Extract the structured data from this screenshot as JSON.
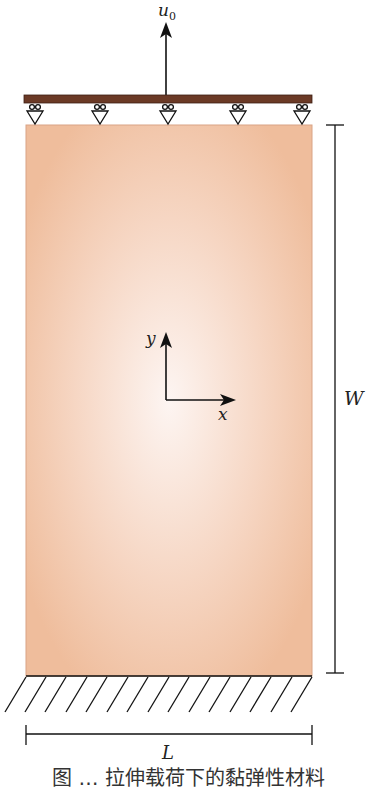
{
  "figure": {
    "labels": {
      "load": "u",
      "load_sub": "0",
      "y_axis": "y",
      "x_axis": "x",
      "height_dim": "W",
      "width_dim": "L"
    },
    "caption": "图 … 拉伸载荷下的黏弹性材料",
    "colors": {
      "body_edge": "#efbd9c",
      "body_center": "#fdf5f2",
      "top_plate": "#6b3a26",
      "lines": "#1a1a1a"
    },
    "supports": {
      "count": 5,
      "x_positions": [
        35,
        100,
        168,
        238,
        302
      ]
    },
    "hatch_count": 15
  }
}
